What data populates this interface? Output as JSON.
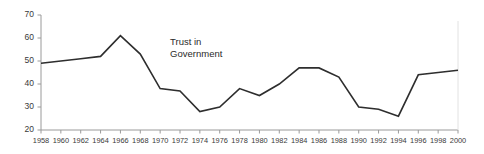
{
  "chart_data": {
    "type": "line",
    "title": "",
    "xlabel": "",
    "ylabel": "",
    "xlim": [
      1958,
      2000
    ],
    "ylim": [
      20,
      70
    ],
    "grid": false,
    "legend_position": "none",
    "annotations": [
      {
        "text_line1": "Trust in",
        "text_line2": "Government",
        "x": 1971,
        "y": 57
      }
    ],
    "xticks": [
      1958,
      1960,
      1962,
      1964,
      1966,
      1968,
      1970,
      1972,
      1974,
      1976,
      1978,
      1980,
      1982,
      1984,
      1986,
      1988,
      1990,
      1992,
      1994,
      1996,
      1998,
      2000
    ],
    "xticklabels": [
      "1958",
      "1960",
      "1962",
      "1964",
      "1966",
      "1968",
      "1970",
      "1972",
      "1974",
      "1976",
      "1978",
      "1980",
      "1982",
      "1984",
      "1986",
      "1988",
      "1990",
      "1992",
      "1994",
      "1996",
      "1998",
      "2000"
    ],
    "yticks": [
      20,
      30,
      40,
      50,
      60,
      70
    ],
    "yticklabels": [
      "20",
      "30",
      "40",
      "50",
      "60",
      "70"
    ],
    "series": [
      {
        "name": "Trust in Government",
        "color": "#2e2e2e",
        "x": [
          1958,
          1960,
          1962,
          1964,
          1966,
          1968,
          1970,
          1972,
          1974,
          1976,
          1978,
          1980,
          1982,
          1984,
          1986,
          1988,
          1990,
          1992,
          1994,
          1996,
          1998,
          2000
        ],
        "values": [
          49,
          50,
          51,
          52,
          61,
          53,
          38,
          37,
          28,
          30,
          38,
          35,
          40,
          47,
          47,
          43,
          30,
          29,
          26,
          44,
          45,
          46
        ]
      }
    ]
  },
  "axes": {
    "y_axis_name": "value-axis",
    "x_axis_name": "year-axis"
  }
}
